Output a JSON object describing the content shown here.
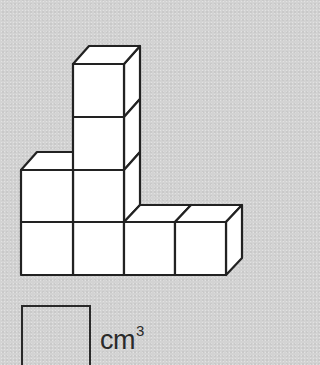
{
  "figure": {
    "cube_count": 8,
    "layout_front_view": {
      "columns": 4,
      "column_heights": [
        2,
        4,
        1,
        1
      ]
    },
    "colors": {
      "background": "#d3d3d3",
      "cube_fill": "#ffffff",
      "outline": "#222222"
    }
  },
  "answer": {
    "box_value": "",
    "unit": "cm",
    "exponent": "3"
  }
}
